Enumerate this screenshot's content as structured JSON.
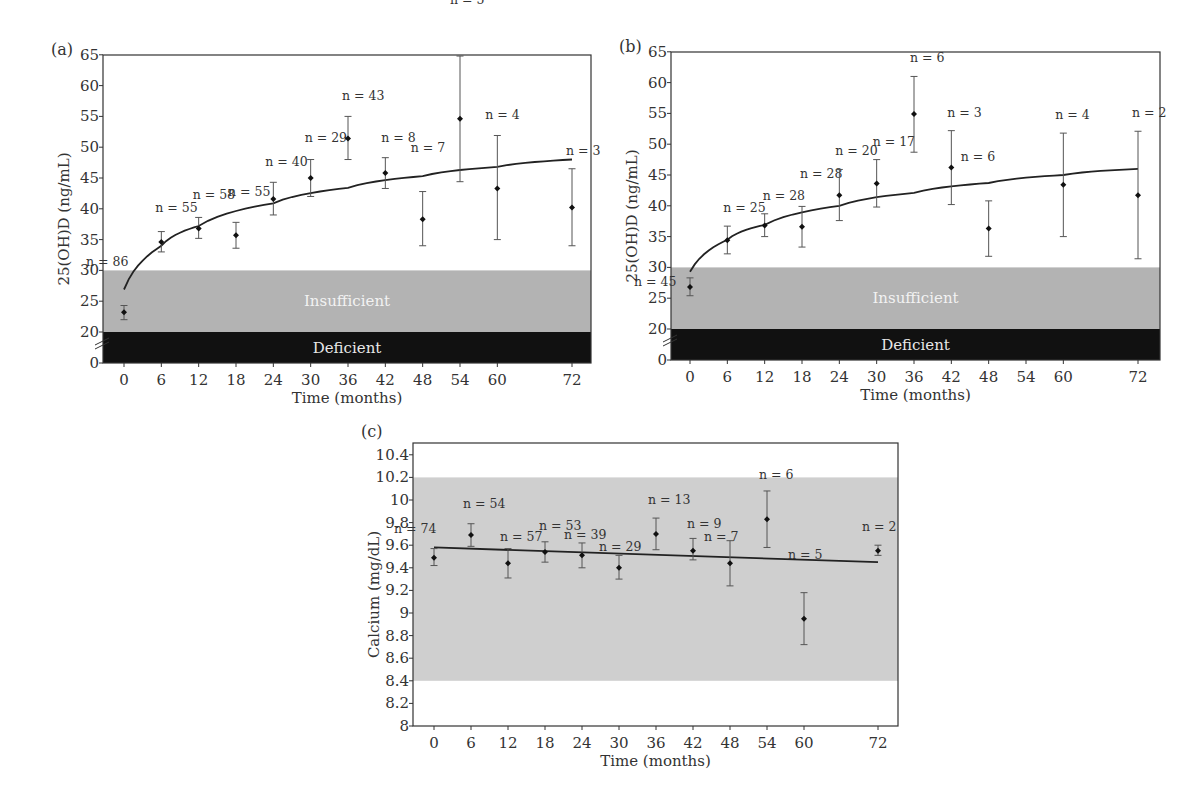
{
  "chart_data": [
    {
      "id": "a",
      "type": "scatter",
      "panel_label": "(a)",
      "title": "",
      "xlabel": "Time (months)",
      "ylabel": "25(OH)D (ng/mL)",
      "xlim": [
        -3,
        75
      ],
      "ylim": [
        0,
        65
      ],
      "axis_break": 20,
      "x_ticks": [
        0,
        6,
        12,
        18,
        24,
        30,
        36,
        42,
        48,
        54,
        60,
        72
      ],
      "y_ticks": [
        0,
        20,
        25,
        30,
        35,
        40,
        45,
        50,
        55,
        60,
        65
      ],
      "bands": [
        {
          "label": "Insufficient",
          "from": 20,
          "to": 30,
          "color": "#b3b3b3",
          "text_color": "#f2f2f2"
        },
        {
          "label": "Deficient",
          "from": 0,
          "to": 20,
          "color": "#111111",
          "text_color": "#e8e8e8"
        }
      ],
      "points": [
        {
          "x": 0,
          "y": 23.2,
          "low": 22.0,
          "high": 24.3,
          "n": "n = 86"
        },
        {
          "x": 6,
          "y": 34.6,
          "low": 33.0,
          "high": 36.3,
          "n": "n = 55"
        },
        {
          "x": 12,
          "y": 36.8,
          "low": 35.2,
          "high": 38.6,
          "n": "n = 58"
        },
        {
          "x": 18,
          "y": 35.7,
          "low": 33.6,
          "high": 37.8,
          "n": "n = 55"
        },
        {
          "x": 24,
          "y": 41.6,
          "low": 39.0,
          "high": 44.3,
          "n": "n = 40"
        },
        {
          "x": 30,
          "y": 45.0,
          "low": 42.0,
          "high": 48.0,
          "n": "n = 29"
        },
        {
          "x": 36,
          "y": 51.4,
          "low": 48.0,
          "high": 55.0,
          "n": "n = 43"
        },
        {
          "x": 42,
          "y": 45.8,
          "low": 43.3,
          "high": 48.3,
          "n": "n = 8"
        },
        {
          "x": 48,
          "y": 38.3,
          "low": 34.0,
          "high": 42.8,
          "n": "n = 7"
        },
        {
          "x": 54,
          "y": 54.6,
          "low": 44.4,
          "high": 64.8,
          "n": "n = 5"
        },
        {
          "x": 60,
          "y": 43.3,
          "low": 35.0,
          "high": 51.9,
          "n": "n = 4"
        },
        {
          "x": 72,
          "y": 40.2,
          "low": 34.0,
          "high": 46.5,
          "n": "n = 3"
        }
      ],
      "fit_curve": {
        "type": "logarithmic",
        "x": [
          0,
          6,
          12,
          24,
          36,
          48,
          60,
          72
        ],
        "y": [
          26.9,
          34.0,
          37.2,
          40.9,
          43.4,
          45.3,
          46.8,
          48.0
        ]
      }
    },
    {
      "id": "b",
      "type": "scatter",
      "panel_label": "(b)",
      "title": "",
      "xlabel": "Time (months)",
      "ylabel": "25(OH)D (ng/mL)",
      "xlim": [
        -3,
        75
      ],
      "ylim": [
        0,
        65
      ],
      "axis_break": 20,
      "x_ticks": [
        0,
        6,
        12,
        18,
        24,
        30,
        36,
        42,
        48,
        54,
        60,
        72
      ],
      "y_ticks": [
        0,
        20,
        25,
        30,
        35,
        40,
        45,
        50,
        55,
        60,
        65
      ],
      "bands": [
        {
          "label": "Insufficient",
          "from": 20,
          "to": 30,
          "color": "#b3b3b3",
          "text_color": "#f2f2f2"
        },
        {
          "label": "Deficient",
          "from": 0,
          "to": 20,
          "color": "#111111",
          "text_color": "#e8e8e8"
        }
      ],
      "points": [
        {
          "x": 0,
          "y": 26.8,
          "low": 25.4,
          "high": 28.3,
          "n": "n = 45"
        },
        {
          "x": 6,
          "y": 34.4,
          "low": 32.2,
          "high": 36.7,
          "n": "n = 25"
        },
        {
          "x": 12,
          "y": 36.8,
          "low": 35.0,
          "high": 38.7,
          "n": "n = 28"
        },
        {
          "x": 18,
          "y": 36.6,
          "low": 33.3,
          "high": 39.9,
          "n": "n = 28"
        },
        {
          "x": 24,
          "y": 41.7,
          "low": 37.6,
          "high": 45.9,
          "n": "n = 20"
        },
        {
          "x": 30,
          "y": 43.6,
          "low": 39.8,
          "high": 47.5,
          "n": "n = 17"
        },
        {
          "x": 36,
          "y": 54.9,
          "low": 48.7,
          "high": 61.0,
          "n": "n = 6"
        },
        {
          "x": 42,
          "y": 46.2,
          "low": 40.2,
          "high": 52.2,
          "n": "n = 3"
        },
        {
          "x": 48,
          "y": 36.3,
          "low": 31.8,
          "high": 40.8,
          "n": "n = 6"
        },
        {
          "x": 60,
          "y": 43.4,
          "low": 35.0,
          "high": 51.8,
          "n": "n = 4"
        },
        {
          "x": 72,
          "y": 41.7,
          "low": 31.4,
          "high": 52.1,
          "n": "n = 2"
        }
      ],
      "fit_curve": {
        "type": "logarithmic",
        "x": [
          0,
          6,
          12,
          24,
          36,
          48,
          60,
          72
        ],
        "y": [
          29.3,
          34.5,
          36.9,
          40.0,
          42.1,
          43.7,
          45.0,
          46.0
        ]
      }
    },
    {
      "id": "c",
      "type": "scatter",
      "panel_label": "(c)",
      "title": "",
      "xlabel": "Time (months)",
      "ylabel": "Calcium (mg/dL)",
      "xlim": [
        -3,
        75
      ],
      "ylim": [
        8,
        10.5
      ],
      "x_ticks": [
        0,
        6,
        12,
        18,
        24,
        30,
        36,
        42,
        48,
        54,
        60,
        72
      ],
      "y_ticks": [
        8,
        8.2,
        8.4,
        8.6,
        8.8,
        9,
        9.2,
        9.4,
        9.6,
        9.8,
        10,
        10.2,
        10.4
      ],
      "bands": [
        {
          "label": "",
          "from": 8.4,
          "to": 10.2,
          "color": "#cfcfcf",
          "text_color": ""
        }
      ],
      "points": [
        {
          "x": 0,
          "y": 9.49,
          "low": 9.42,
          "high": 9.57,
          "n": "n = 74"
        },
        {
          "x": 6,
          "y": 9.69,
          "low": 9.59,
          "high": 9.79,
          "n": "n = 54"
        },
        {
          "x": 12,
          "y": 9.44,
          "low": 9.31,
          "high": 9.57,
          "n": "n = 57"
        },
        {
          "x": 18,
          "y": 9.54,
          "low": 9.45,
          "high": 9.63,
          "n": "n = 53"
        },
        {
          "x": 24,
          "y": 9.51,
          "low": 9.4,
          "high": 9.62,
          "n": "n = 39"
        },
        {
          "x": 30,
          "y": 9.4,
          "low": 9.3,
          "high": 9.51,
          "n": "n = 29"
        },
        {
          "x": 36,
          "y": 9.7,
          "low": 9.56,
          "high": 9.84,
          "n": "n = 13"
        },
        {
          "x": 42,
          "y": 9.55,
          "low": 9.47,
          "high": 9.66,
          "n": "n = 9"
        },
        {
          "x": 48,
          "y": 9.44,
          "low": 9.24,
          "high": 9.64,
          "n": "n = 7"
        },
        {
          "x": 54,
          "y": 9.83,
          "low": 9.58,
          "high": 10.08,
          "n": "n = 6"
        },
        {
          "x": 60,
          "y": 8.95,
          "low": 8.72,
          "high": 9.18,
          "n": "n = 5"
        },
        {
          "x": 72,
          "y": 9.55,
          "low": 9.51,
          "high": 9.6,
          "n": "n = 2"
        }
      ],
      "fit_curve": {
        "type": "linear",
        "x": [
          0,
          72
        ],
        "y": [
          9.58,
          9.45
        ]
      }
    }
  ]
}
